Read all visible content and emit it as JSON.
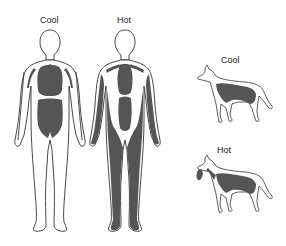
{
  "diagram": {
    "humans": [
      {
        "label": "Cool",
        "condition": "cool"
      },
      {
        "label": "Hot",
        "condition": "hot"
      }
    ],
    "dogs": [
      {
        "label": "Cool",
        "condition": "cool"
      },
      {
        "label": "Hot",
        "condition": "hot"
      }
    ]
  },
  "colors": {
    "outline": "#333333",
    "blood_fill": "#555555",
    "background": "#ffffff",
    "text": "#222222"
  }
}
